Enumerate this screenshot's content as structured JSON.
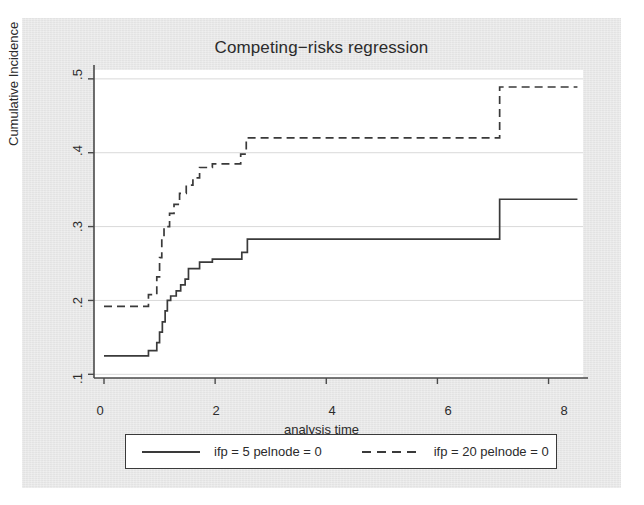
{
  "chart_data": {
    "type": "line",
    "title": "Competing−risks regression",
    "xlabel": "analysis time",
    "ylabel": "Cumulative Incidence",
    "xlim": [
      -0.18,
      8.62
    ],
    "ylim": [
      0.095,
      0.512
    ],
    "xticks": [
      "0",
      "2",
      "4",
      "6",
      "8"
    ],
    "xtick_values": [
      0,
      2,
      4,
      6,
      8
    ],
    "yticks": [
      ".1",
      ".2",
      ".3",
      ".4",
      ".5"
    ],
    "ytick_values": [
      0.1,
      0.2,
      0.3,
      0.4,
      0.5
    ],
    "grid": "horizontal",
    "legend_position": "below-plot",
    "series": [
      {
        "name": "ifp = 5 pelnode = 0",
        "style": "solid",
        "color": "#3a3a3a",
        "steps": [
          [
            0.0,
            0.125
          ],
          [
            0.8,
            0.125
          ],
          [
            0.8,
            0.132
          ],
          [
            0.95,
            0.132
          ],
          [
            0.95,
            0.143
          ],
          [
            1.0,
            0.143
          ],
          [
            1.0,
            0.157
          ],
          [
            1.05,
            0.157
          ],
          [
            1.05,
            0.171
          ],
          [
            1.1,
            0.171
          ],
          [
            1.1,
            0.186
          ],
          [
            1.14,
            0.186
          ],
          [
            1.14,
            0.2
          ],
          [
            1.2,
            0.2
          ],
          [
            1.2,
            0.206
          ],
          [
            1.3,
            0.206
          ],
          [
            1.3,
            0.213
          ],
          [
            1.38,
            0.213
          ],
          [
            1.38,
            0.221
          ],
          [
            1.46,
            0.221
          ],
          [
            1.46,
            0.229
          ],
          [
            1.52,
            0.229
          ],
          [
            1.52,
            0.243
          ],
          [
            1.72,
            0.243
          ],
          [
            1.72,
            0.252
          ],
          [
            1.95,
            0.252
          ],
          [
            1.95,
            0.256
          ],
          [
            2.48,
            0.256
          ],
          [
            2.48,
            0.265
          ],
          [
            2.58,
            0.265
          ],
          [
            2.58,
            0.283
          ],
          [
            7.12,
            0.283
          ],
          [
            7.12,
            0.337
          ],
          [
            8.52,
            0.337
          ]
        ]
      },
      {
        "name": "ifp = 20 pelnode = 0",
        "style": "dashed",
        "color": "#3a3a3a",
        "steps": [
          [
            0.0,
            0.192
          ],
          [
            0.8,
            0.192
          ],
          [
            0.8,
            0.208
          ],
          [
            0.95,
            0.208
          ],
          [
            0.95,
            0.232
          ],
          [
            1.0,
            0.232
          ],
          [
            1.0,
            0.258
          ],
          [
            1.04,
            0.258
          ],
          [
            1.04,
            0.286
          ],
          [
            1.08,
            0.286
          ],
          [
            1.08,
            0.3
          ],
          [
            1.18,
            0.3
          ],
          [
            1.18,
            0.318
          ],
          [
            1.26,
            0.318
          ],
          [
            1.26,
            0.33
          ],
          [
            1.36,
            0.33
          ],
          [
            1.36,
            0.345
          ],
          [
            1.48,
            0.345
          ],
          [
            1.48,
            0.356
          ],
          [
            1.6,
            0.356
          ],
          [
            1.6,
            0.366
          ],
          [
            1.72,
            0.366
          ],
          [
            1.72,
            0.38
          ],
          [
            1.95,
            0.38
          ],
          [
            1.95,
            0.385
          ],
          [
            2.46,
            0.385
          ],
          [
            2.46,
            0.398
          ],
          [
            2.56,
            0.398
          ],
          [
            2.56,
            0.42
          ],
          [
            7.12,
            0.42
          ],
          [
            7.12,
            0.489
          ],
          [
            8.52,
            0.489
          ]
        ]
      }
    ]
  },
  "legend": {
    "entries": [
      {
        "label": "ifp = 5 pelnode = 0",
        "style": "solid"
      },
      {
        "label": "ifp = 20 pelnode = 0",
        "style": "dashed"
      }
    ]
  }
}
